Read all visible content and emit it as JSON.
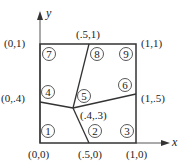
{
  "diagram": {
    "axes": {
      "x_label": "x",
      "y_label": "y"
    },
    "vertex_labels": {
      "origin": "(0,0)",
      "bottom_mid": "(.5,0)",
      "bottom_right": "(1,0)",
      "left_mid": "(0,.4)",
      "top_left": "(0,1)",
      "top_mid": "(.5,1)",
      "top_right": "(1,1)",
      "right_mid": "(1,.5)",
      "center": "(.4,.3)"
    },
    "node_numbers": [
      "1",
      "2",
      "3",
      "4",
      "5",
      "6",
      "7",
      "8",
      "9"
    ],
    "colors": {
      "line": "#333333",
      "text": "#222222",
      "background": "#ffffff"
    }
  }
}
